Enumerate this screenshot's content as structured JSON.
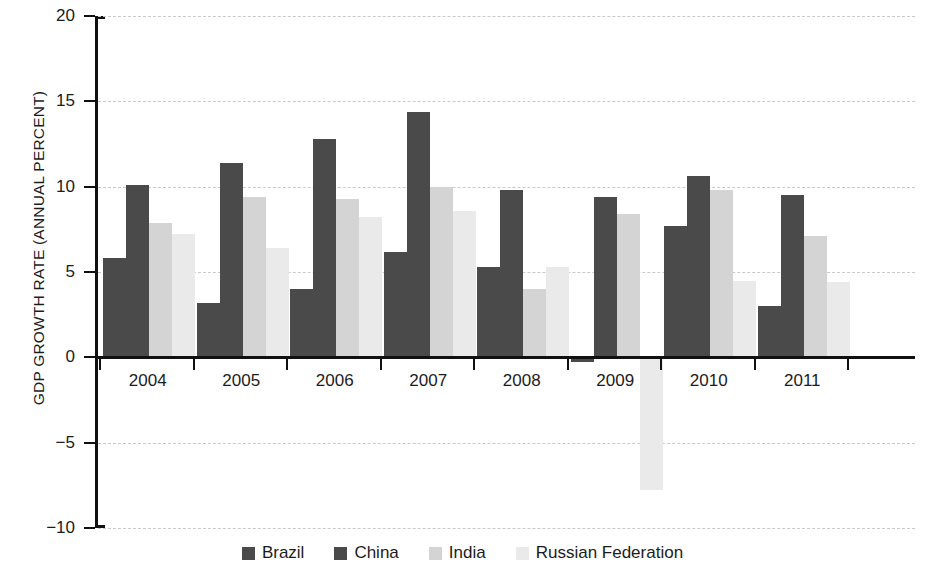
{
  "chart_data": {
    "type": "bar",
    "title": "",
    "xlabel": "",
    "ylabel": "GDP GROWTH RATE (ANNUAL PERCENT)",
    "categories": [
      "2004",
      "2005",
      "2006",
      "2007",
      "2008",
      "2009",
      "2010",
      "2011"
    ],
    "series": [
      {
        "name": "Brazil",
        "color": "#4a4a4a",
        "values": [
          5.8,
          3.2,
          4.0,
          6.2,
          5.3,
          -0.3,
          7.7,
          3.0
        ]
      },
      {
        "name": "China",
        "color": "#4a4a4a",
        "values": [
          10.1,
          11.4,
          12.8,
          14.4,
          9.8,
          9.4,
          10.6,
          9.5
        ]
      },
      {
        "name": "India",
        "color": "#d4d4d4",
        "values": [
          7.9,
          9.4,
          9.3,
          10.0,
          4.0,
          8.4,
          9.8,
          7.1
        ]
      },
      {
        "name": "Russian Federation",
        "color": "#eaeaea",
        "values": [
          7.2,
          6.4,
          8.2,
          8.6,
          5.3,
          -7.8,
          4.5,
          4.4
        ]
      }
    ],
    "ylim": [
      -10,
      20
    ],
    "yticks": [
      20,
      15,
      10,
      5,
      0,
      -5,
      -10
    ],
    "ytick_labels": [
      "20",
      "15",
      "10",
      "5",
      "0",
      "−5",
      "−10"
    ],
    "grid": true,
    "grid_style": "dashed-horizontal",
    "legend_position": "bottom-center",
    "axis_color": "#111111",
    "grid_color": "#c9c9c9",
    "background": "#ffffff"
  },
  "legend": {
    "items": [
      {
        "label": "Brazil",
        "swatch": "#4a4a4a"
      },
      {
        "label": "China",
        "swatch": "#4a4a4a"
      },
      {
        "label": "India",
        "swatch": "#d4d4d4"
      },
      {
        "label": "Russian Federation",
        "swatch": "#eaeaea"
      }
    ]
  }
}
